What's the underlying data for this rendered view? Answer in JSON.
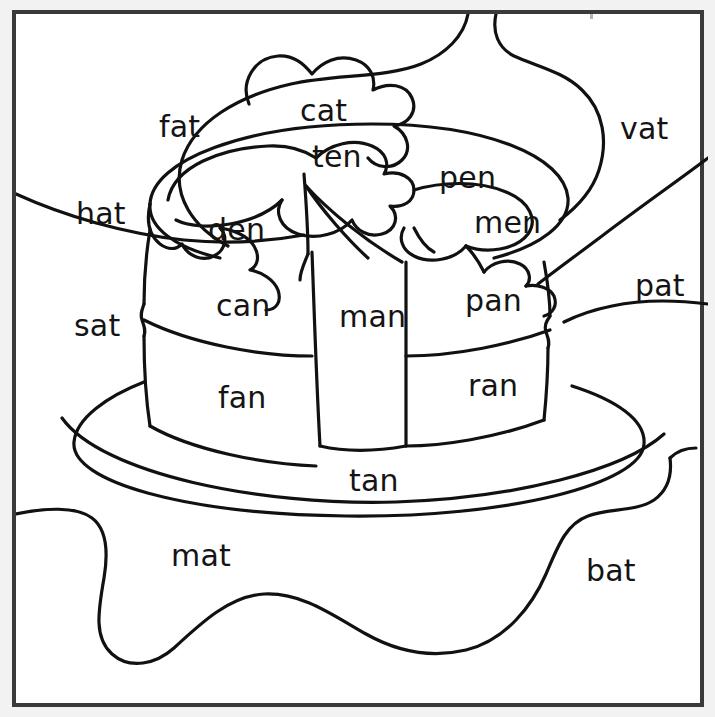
{
  "page": {
    "kind": "coloring-worksheet",
    "frame_color": "#3a3a3a",
    "ink_color": "#111111",
    "paper_color": "#ffffff"
  },
  "labels": [
    {
      "id": "fat",
      "text": "fat",
      "x": 143,
      "y": 98,
      "region": "background-top-left-blob"
    },
    {
      "id": "cat",
      "text": "cat",
      "x": 284,
      "y": 82,
      "region": "candle-flame-blob"
    },
    {
      "id": "vat",
      "text": "vat",
      "x": 604,
      "y": 100,
      "region": "background-top-right"
    },
    {
      "id": "ten",
      "text": "ten",
      "x": 296,
      "y": 128,
      "region": "frosting-top-left"
    },
    {
      "id": "pen",
      "text": "pen",
      "x": 423,
      "y": 149,
      "region": "frosting-top-right"
    },
    {
      "id": "hat",
      "text": "hat",
      "x": 60,
      "y": 185,
      "region": "background-left"
    },
    {
      "id": "den",
      "text": "den",
      "x": 192,
      "y": 201,
      "region": "frosting-drip-left"
    },
    {
      "id": "men",
      "text": "men",
      "x": 458,
      "y": 194,
      "region": "frosting-drip-right"
    },
    {
      "id": "pat",
      "text": "pat",
      "x": 619,
      "y": 257,
      "region": "background-right"
    },
    {
      "id": "can",
      "text": "can",
      "x": 200,
      "y": 277,
      "region": "cake-upper-left-layer"
    },
    {
      "id": "man",
      "text": "man",
      "x": 323,
      "y": 288,
      "region": "cake-cut-face"
    },
    {
      "id": "pan",
      "text": "pan",
      "x": 449,
      "y": 272,
      "region": "cake-upper-right-layer"
    },
    {
      "id": "sat",
      "text": "sat",
      "x": 58,
      "y": 297,
      "region": "background-left-lower"
    },
    {
      "id": "fan",
      "text": "fan",
      "x": 202,
      "y": 369,
      "region": "cake-lower-left-layer"
    },
    {
      "id": "ran",
      "text": "ran",
      "x": 452,
      "y": 357,
      "region": "cake-lower-right-layer"
    },
    {
      "id": "tan",
      "text": "tan",
      "x": 333,
      "y": 452,
      "region": "plate-front"
    },
    {
      "id": "mat",
      "text": "mat",
      "x": 155,
      "y": 527,
      "region": "tablecloth-middle"
    },
    {
      "id": "bat",
      "text": "bat",
      "x": 570,
      "y": 542,
      "region": "tablecloth-right"
    }
  ],
  "word_families": {
    "at": [
      "fat",
      "cat",
      "vat",
      "hat",
      "pat",
      "sat",
      "mat",
      "bat"
    ],
    "en": [
      "ten",
      "pen",
      "den",
      "men"
    ],
    "an": [
      "can",
      "man",
      "pan",
      "fan",
      "ran",
      "tan"
    ]
  }
}
